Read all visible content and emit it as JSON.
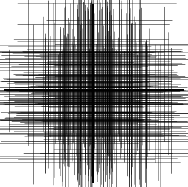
{
  "image": {
    "description": "Dense grid of horizontal and vertical lines, darkest at center, with a bold central cross",
    "width": 188,
    "height": 187,
    "background": "#ffffff",
    "line_color": "#000000",
    "cross": {
      "x": 93,
      "y": 90,
      "color": "#000000"
    },
    "line_count": 170,
    "seed": 7
  }
}
